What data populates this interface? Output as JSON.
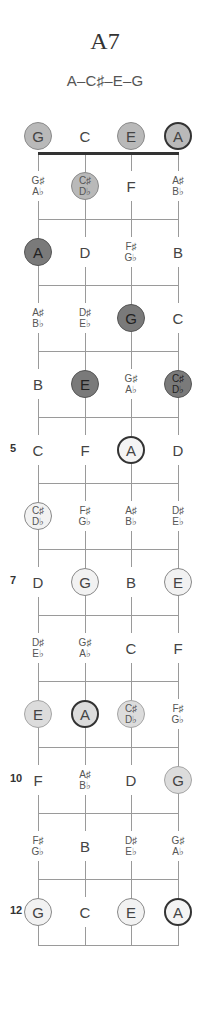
{
  "chord": {
    "name": "A7",
    "notes": "A–C♯–E–G"
  },
  "strings": [
    "G",
    "C",
    "E",
    "A"
  ],
  "fret_numbers": [
    {
      "fret": 5,
      "label": "5"
    },
    {
      "fret": 7,
      "label": "7"
    },
    {
      "fret": 10,
      "label": "10"
    },
    {
      "fret": 12,
      "label": "12"
    }
  ],
  "rows": [
    {
      "fret": 0,
      "cells": [
        {
          "top": "G",
          "style": "mid"
        },
        {
          "top": "C",
          "style": "none"
        },
        {
          "top": "E",
          "style": "mid"
        },
        {
          "top": "A",
          "style": "mid-root"
        }
      ]
    },
    {
      "fret": 1,
      "cells": [
        {
          "top": "G♯",
          "bottom": "A♭",
          "style": "none"
        },
        {
          "top": "C♯",
          "bottom": "D♭",
          "style": "mid"
        },
        {
          "top": "F",
          "style": "none"
        },
        {
          "top": "A♯",
          "bottom": "B♭",
          "style": "none"
        }
      ]
    },
    {
      "fret": 2,
      "cells": [
        {
          "top": "A",
          "style": "dark"
        },
        {
          "top": "D",
          "style": "none"
        },
        {
          "top": "F♯",
          "bottom": "G♭",
          "style": "none"
        },
        {
          "top": "B",
          "style": "none"
        }
      ]
    },
    {
      "fret": 3,
      "cells": [
        {
          "top": "A♯",
          "bottom": "B♭",
          "style": "none"
        },
        {
          "top": "D♯",
          "bottom": "E♭",
          "style": "none"
        },
        {
          "top": "G",
          "style": "dark"
        },
        {
          "top": "C",
          "style": "none"
        }
      ]
    },
    {
      "fret": 4,
      "cells": [
        {
          "top": "B",
          "style": "none"
        },
        {
          "top": "E",
          "style": "dark"
        },
        {
          "top": "G♯",
          "bottom": "A♭",
          "style": "none"
        },
        {
          "top": "C♯",
          "bottom": "D♭",
          "style": "dark"
        }
      ]
    },
    {
      "fret": 5,
      "cells": [
        {
          "top": "C",
          "style": "none"
        },
        {
          "top": "F",
          "style": "none"
        },
        {
          "top": "A",
          "style": "outline-root"
        },
        {
          "top": "D",
          "style": "none"
        }
      ]
    },
    {
      "fret": 6,
      "cells": [
        {
          "top": "C♯",
          "bottom": "D♭",
          "style": "outline"
        },
        {
          "top": "F♯",
          "bottom": "G♭",
          "style": "none"
        },
        {
          "top": "A♯",
          "bottom": "B♭",
          "style": "none"
        },
        {
          "top": "D♯",
          "bottom": "E♭",
          "style": "none"
        }
      ]
    },
    {
      "fret": 7,
      "cells": [
        {
          "top": "D",
          "style": "none"
        },
        {
          "top": "G",
          "style": "outline"
        },
        {
          "top": "B",
          "style": "none"
        },
        {
          "top": "E",
          "style": "outline"
        }
      ]
    },
    {
      "fret": 8,
      "cells": [
        {
          "top": "D♯",
          "bottom": "E♭",
          "style": "none"
        },
        {
          "top": "G♯",
          "bottom": "A♭",
          "style": "none"
        },
        {
          "top": "C",
          "style": "none"
        },
        {
          "top": "F",
          "style": "none"
        }
      ]
    },
    {
      "fret": 9,
      "cells": [
        {
          "top": "E",
          "style": "light"
        },
        {
          "top": "A",
          "style": "light-root"
        },
        {
          "top": "C♯",
          "bottom": "D♭",
          "style": "light"
        },
        {
          "top": "F♯",
          "bottom": "G♭",
          "style": "none"
        }
      ]
    },
    {
      "fret": 10,
      "cells": [
        {
          "top": "F",
          "style": "none"
        },
        {
          "top": "A♯",
          "bottom": "B♭",
          "style": "none"
        },
        {
          "top": "D",
          "style": "none"
        },
        {
          "top": "G",
          "style": "light"
        }
      ]
    },
    {
      "fret": 11,
      "cells": [
        {
          "top": "F♯",
          "bottom": "G♭",
          "style": "none"
        },
        {
          "top": "B",
          "style": "none"
        },
        {
          "top": "D♯",
          "bottom": "E♭",
          "style": "none"
        },
        {
          "top": "G♯",
          "bottom": "A♭",
          "style": "none"
        }
      ]
    },
    {
      "fret": 12,
      "cells": [
        {
          "top": "G",
          "style": "white"
        },
        {
          "top": "C",
          "style": "none"
        },
        {
          "top": "E",
          "style": "white"
        },
        {
          "top": "A",
          "style": "white-root"
        }
      ]
    }
  ],
  "colors": {
    "dark_dot": "#7a7a7a",
    "mid_dot": "#b9b9b9",
    "light_dot": "#dcdcdc",
    "nut": "#333333",
    "line": "#9a9a9a"
  }
}
